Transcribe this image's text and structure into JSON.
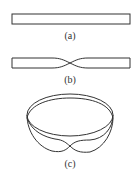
{
  "figure": {
    "panels": [
      {
        "id": "a",
        "label": "(a)",
        "description": "flat strip"
      },
      {
        "id": "b",
        "label": "(b)",
        "description": "strip with half twist"
      },
      {
        "id": "c",
        "label": "(c)",
        "description": "Mobius band"
      }
    ],
    "stroke_color": "#333333"
  }
}
